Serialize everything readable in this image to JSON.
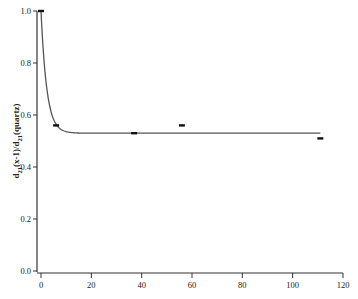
{
  "chart_data": {
    "type": "scatter",
    "title": "",
    "xlabel": "",
    "ylabel": "d21(x-1)/d21(quartz)",
    "ylabel_parts": {
      "d1": "d",
      "s1": "21",
      "mid": "(x-1)/d",
      "s2": "21",
      "end": "(quartz)"
    },
    "xlim": [
      0,
      120
    ],
    "ylim": [
      0.0,
      1.0
    ],
    "x_ticks": [
      0,
      20,
      40,
      60,
      80,
      100,
      120
    ],
    "y_ticks": [
      "0.0",
      "0.2",
      "0.4",
      "0.6",
      "0.8",
      "1.0"
    ],
    "grid": false,
    "legend": null,
    "series": [
      {
        "name": "measured",
        "marker": "short horizontal dash",
        "x": [
          0,
          6,
          37,
          56,
          111
        ],
        "y": [
          1.0,
          0.56,
          0.53,
          0.56,
          0.51
        ]
      },
      {
        "name": "fit",
        "style": "solid line",
        "model": "exponential decay to plateau",
        "x_range": [
          0,
          111
        ],
        "start": 1.0,
        "plateau": 0.53,
        "decay_constant": 2.3
      }
    ]
  },
  "style": {
    "axis_color": "#333333",
    "curve_color": "#555555",
    "marker_color": "#111111"
  }
}
